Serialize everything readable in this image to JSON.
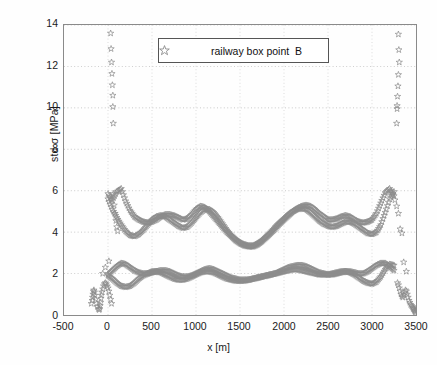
{
  "figure": {
    "title": "",
    "background": "#ffffff",
    "marker_color": "#8c8c8c",
    "axis_color": "#8a8a8a",
    "grid_color": "#9a9a9a"
  },
  "axes": {
    "xlabel": "x [m]",
    "ylabel": "std σ [MPa]",
    "xticks": [
      "-500",
      "0",
      "500",
      "1000",
      "1500",
      "2000",
      "2500",
      "3000",
      "3500"
    ],
    "yticks": [
      "0",
      "2",
      "4",
      "6",
      "8",
      "10",
      "12",
      "14"
    ],
    "xlim": [
      -500,
      3500
    ],
    "ylim": [
      0,
      14
    ]
  },
  "legend": {
    "label": "railway box point  B",
    "marker": "star-marker",
    "position": "top-center"
  },
  "chart_data": {
    "type": "scatter",
    "title": "",
    "xlabel": "x [m]",
    "ylabel": "std σ [MPa]",
    "xlim": [
      -500,
      3500
    ],
    "ylim": [
      0,
      14
    ],
    "grid": true,
    "legend_position": "top-center",
    "marker": "star",
    "series": [
      {
        "name": "railway box point  B - upper outlier column (left)",
        "x": [
          30,
          35,
          40,
          45,
          50,
          55,
          55,
          60
        ],
        "y": [
          13.6,
          12.85,
          12.2,
          11.65,
          11.1,
          10.6,
          10.05,
          9.25
        ]
      },
      {
        "name": "railway box point  B - upper outlier column (right)",
        "x": [
          3300,
          3305,
          3310,
          3300,
          3295,
          3290,
          3285,
          3285,
          3280
        ],
        "y": [
          13.55,
          12.8,
          12.2,
          11.6,
          11.05,
          10.55,
          10.1,
          9.95,
          9.25
        ]
      },
      {
        "name": "railway box point  B - band upper A",
        "x": [
          0,
          50,
          100,
          150,
          200,
          250,
          300,
          350,
          400,
          450,
          500,
          550,
          600,
          650,
          700,
          750,
          800,
          850,
          900,
          950,
          1000,
          1050,
          1100,
          1150,
          1200,
          1250,
          1300,
          1350,
          1400,
          1450,
          1500,
          1550,
          1600,
          1650,
          1700,
          1750,
          1800,
          1850,
          1900,
          1950,
          2000,
          2050,
          2100,
          2150,
          2200,
          2250,
          2300,
          2350,
          2400,
          2450,
          2500,
          2550,
          2600,
          2650,
          2700,
          2750,
          2800,
          2850,
          2900,
          2950,
          3000,
          3050,
          3100,
          3150,
          3200,
          3250
        ],
        "y": [
          5.85,
          5.55,
          5.95,
          6.1,
          5.5,
          5.05,
          4.75,
          4.6,
          4.5,
          4.45,
          4.5,
          4.6,
          4.75,
          4.85,
          4.85,
          4.8,
          4.7,
          4.6,
          4.65,
          4.85,
          5.1,
          5.25,
          5.2,
          5.0,
          4.75,
          4.5,
          4.25,
          4.0,
          3.8,
          3.6,
          3.45,
          3.35,
          3.3,
          3.3,
          3.4,
          3.55,
          3.75,
          3.95,
          4.15,
          4.4,
          4.6,
          4.8,
          5.0,
          5.15,
          5.25,
          5.3,
          5.25,
          5.1,
          4.9,
          4.75,
          4.6,
          4.6,
          4.65,
          4.75,
          4.8,
          4.75,
          4.6,
          4.5,
          4.45,
          4.5,
          4.6,
          4.9,
          5.4,
          5.9,
          6.1,
          5.75
        ]
      },
      {
        "name": "railway box point  B - band upper B",
        "x": [
          0,
          50,
          100,
          150,
          200,
          250,
          300,
          350,
          400,
          450,
          500,
          550,
          600,
          650,
          700,
          750,
          800,
          850,
          900,
          950,
          1000,
          1050,
          1100,
          1150,
          1200,
          1250,
          1300,
          1350,
          1400,
          1450,
          1500,
          1550,
          1600,
          1650,
          1700,
          1750,
          1800,
          1850,
          1900,
          1950,
          2000,
          2050,
          2100,
          2150,
          2200,
          2250,
          2300,
          2350,
          2400,
          2450,
          2500,
          2550,
          2600,
          2650,
          2700,
          2750,
          2800,
          2850,
          2900,
          2950,
          3000,
          3050,
          3100,
          3150,
          3200,
          3250
        ],
        "y": [
          5.6,
          5.1,
          4.7,
          4.35,
          4.05,
          3.85,
          3.8,
          3.9,
          4.1,
          4.35,
          4.6,
          4.75,
          4.8,
          4.75,
          4.6,
          4.45,
          4.3,
          4.2,
          4.25,
          4.45,
          4.7,
          4.95,
          5.1,
          5.1,
          4.95,
          4.7,
          4.4,
          4.1,
          3.85,
          3.65,
          3.5,
          3.4,
          3.35,
          3.35,
          3.45,
          3.6,
          3.8,
          4.0,
          4.25,
          4.45,
          4.65,
          4.85,
          5.0,
          5.1,
          5.15,
          5.1,
          4.95,
          4.75,
          4.55,
          4.4,
          4.3,
          4.25,
          4.3,
          4.4,
          4.5,
          4.5,
          4.4,
          4.25,
          4.1,
          3.95,
          3.9,
          4.0,
          4.35,
          4.95,
          5.6,
          5.95
        ]
      },
      {
        "name": "railway box point  B - band lower A",
        "x": [
          0,
          50,
          100,
          150,
          200,
          250,
          300,
          350,
          400,
          450,
          500,
          550,
          600,
          650,
          700,
          750,
          800,
          850,
          900,
          950,
          1000,
          1050,
          1100,
          1150,
          1200,
          1250,
          1300,
          1350,
          1400,
          1450,
          1500,
          1550,
          1600,
          1650,
          1700,
          1750,
          1800,
          1850,
          1900,
          1950,
          2000,
          2050,
          2100,
          2150,
          2200,
          2250,
          2300,
          2350,
          2400,
          2450,
          2500,
          2550,
          2600,
          2650,
          2700,
          2750,
          2800,
          2850,
          2900,
          2950,
          3000,
          3050,
          3100,
          3150,
          3200,
          3250
        ],
        "y": [
          1.95,
          2.15,
          2.35,
          2.5,
          2.45,
          2.3,
          2.15,
          2.05,
          2.0,
          2.0,
          2.05,
          2.1,
          2.15,
          2.15,
          2.1,
          2.0,
          1.9,
          1.85,
          1.85,
          1.9,
          2.0,
          2.1,
          2.2,
          2.25,
          2.2,
          2.1,
          2.0,
          1.9,
          1.8,
          1.75,
          1.7,
          1.7,
          1.7,
          1.75,
          1.8,
          1.85,
          1.9,
          1.95,
          2.0,
          2.1,
          2.2,
          2.3,
          2.35,
          2.4,
          2.4,
          2.35,
          2.25,
          2.15,
          2.05,
          2.0,
          1.95,
          1.95,
          2.0,
          2.05,
          2.1,
          2.1,
          2.05,
          2.0,
          2.0,
          2.1,
          2.25,
          2.4,
          2.5,
          2.5,
          2.35,
          2.15
        ]
      },
      {
        "name": "railway box point  B - band lower B",
        "x": [
          0,
          50,
          100,
          150,
          200,
          250,
          300,
          350,
          400,
          450,
          500,
          550,
          600,
          650,
          700,
          750,
          800,
          850,
          900,
          950,
          1000,
          1050,
          1100,
          1150,
          1200,
          1250,
          1300,
          1350,
          1400,
          1450,
          1500,
          1550,
          1600,
          1650,
          1700,
          1750,
          1800,
          1850,
          1900,
          1950,
          2000,
          2050,
          2100,
          2150,
          2200,
          2250,
          2300,
          2350,
          2400,
          2450,
          2500,
          2550,
          2600,
          2650,
          2700,
          2750,
          2800,
          2850,
          2900,
          2950,
          3000,
          3050,
          3100,
          3150,
          3200,
          3250
        ],
        "y": [
          1.9,
          1.75,
          1.55,
          1.4,
          1.35,
          1.4,
          1.55,
          1.75,
          1.9,
          2.0,
          2.1,
          2.1,
          2.05,
          1.95,
          1.85,
          1.75,
          1.7,
          1.7,
          1.75,
          1.85,
          1.95,
          2.05,
          2.1,
          2.1,
          2.05,
          1.95,
          1.85,
          1.75,
          1.7,
          1.65,
          1.65,
          1.65,
          1.7,
          1.75,
          1.8,
          1.85,
          1.9,
          1.95,
          2.0,
          2.05,
          2.1,
          2.15,
          2.2,
          2.2,
          2.15,
          2.1,
          2.05,
          2.0,
          1.95,
          1.95,
          1.95,
          2.0,
          2.05,
          2.1,
          2.1,
          2.05,
          1.95,
          1.8,
          1.65,
          1.55,
          1.5,
          1.6,
          1.85,
          2.2,
          2.45,
          2.4
        ]
      },
      {
        "name": "railway box point  B - low cluster (left)",
        "x": [
          -190,
          -180,
          -175,
          -170,
          -165,
          -160,
          -155,
          -150,
          -140,
          -130,
          -120,
          -110,
          -100,
          -95,
          -90,
          -85,
          -80,
          -75,
          -70,
          -60,
          -50,
          -40,
          -30,
          -20,
          -10,
          0,
          10,
          20,
          30,
          40
        ],
        "y": [
          0.55,
          0.7,
          0.85,
          1.0,
          1.15,
          1.2,
          1.1,
          0.95,
          0.75,
          0.55,
          0.4,
          0.3,
          0.25,
          0.3,
          0.45,
          0.6,
          0.8,
          0.95,
          1.1,
          1.25,
          1.4,
          1.5,
          1.55,
          1.5,
          1.4,
          1.3,
          1.15,
          0.95,
          0.75,
          0.55
        ]
      },
      {
        "name": "railway box point  B - low cluster (right)",
        "x": [
          3290,
          3300,
          3310,
          3320,
          3330,
          3340,
          3350,
          3360,
          3370,
          3380,
          3390,
          3400,
          3410,
          3420,
          3430,
          3440,
          3450,
          3460,
          3465,
          3470,
          3475,
          3480,
          3485,
          3490,
          3492,
          3495
        ],
        "y": [
          1.55,
          1.45,
          1.3,
          1.15,
          1.0,
          0.9,
          0.85,
          0.95,
          1.1,
          1.2,
          1.15,
          1.0,
          0.85,
          0.7,
          0.6,
          0.5,
          0.45,
          0.4,
          0.35,
          0.3,
          0.3,
          0.25,
          0.2,
          0.2,
          0.15,
          0.1
        ]
      },
      {
        "name": "railway box point  B - sparse mid (left)",
        "x": [
          -60,
          -30,
          10,
          40,
          60,
          70,
          80,
          90,
          100,
          110
        ],
        "y": [
          2.0,
          2.3,
          2.6,
          5.55,
          5.85,
          5.3,
          4.9,
          4.55,
          4.25,
          4.05
        ]
      },
      {
        "name": "railway box point  B - sparse mid (right)",
        "x": [
          3260,
          3280,
          3300,
          3320,
          3340,
          3360,
          3390
        ],
        "y": [
          5.55,
          5.25,
          4.9,
          4.15,
          3.95,
          2.55,
          2.1
        ]
      }
    ]
  }
}
